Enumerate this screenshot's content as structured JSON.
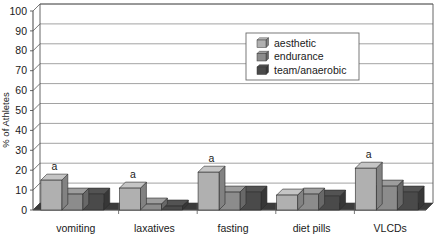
{
  "chart_data": {
    "type": "bar",
    "title": "",
    "subtitle": "",
    "xlabel": "",
    "ylabel": "% of Athletes",
    "ylim": [
      0,
      100
    ],
    "ytick_step": 10,
    "yticks": [
      "0",
      "10",
      "20",
      "30",
      "40",
      "50",
      "60",
      "70",
      "80",
      "90",
      "100"
    ],
    "grid": true,
    "grid_axis": "y",
    "legend_position": "top-center-right",
    "three_d": true,
    "categories": [
      "vomiting",
      "laxatives",
      "fasting",
      "diet pills",
      "VLCDs"
    ],
    "series": [
      {
        "name": "aesthetic",
        "color": "#b0b0b0",
        "values": [
          15,
          11,
          19,
          7.5,
          21
        ]
      },
      {
        "name": "endurance",
        "color": "#8c8c8c",
        "values": [
          8,
          3,
          9,
          8,
          12
        ]
      },
      {
        "name": "team/anaerobic",
        "color": "#4a4a4a",
        "values": [
          8,
          2,
          9,
          7,
          9
        ]
      }
    ],
    "annotations": [
      {
        "text": "a",
        "category": "vomiting",
        "series": "aesthetic"
      },
      {
        "text": "a",
        "category": "laxatives",
        "series": "aesthetic"
      },
      {
        "text": "a",
        "category": "fasting",
        "series": "aesthetic"
      },
      {
        "text": "a",
        "category": "VLCDs",
        "series": "aesthetic"
      }
    ]
  },
  "legend": {
    "items": [
      {
        "label": "aesthetic",
        "swatch": "#b0b0b0"
      },
      {
        "label": "endurance",
        "swatch": "#8c8c8c"
      },
      {
        "label": "team/anaerobic",
        "swatch": "#4a4a4a"
      }
    ]
  },
  "axes": {
    "y_title": "% of Athletes",
    "y_tick_labels": [
      "100",
      "90",
      "80",
      "70",
      "60",
      "50",
      "40",
      "30",
      "20",
      "10",
      "0"
    ],
    "x_tick_labels": [
      "vomiting",
      "laxatives",
      "fasting",
      "diet pills",
      "VLCDs"
    ]
  },
  "colors": {
    "aesthetic": "#b0b0b0",
    "endurance": "#8c8c8c",
    "team_anaerobic": "#4a4a4a",
    "grid": "#8a8a8a",
    "axis": "#555555",
    "floor": "#3b3b3b",
    "background": "#ffffff"
  }
}
